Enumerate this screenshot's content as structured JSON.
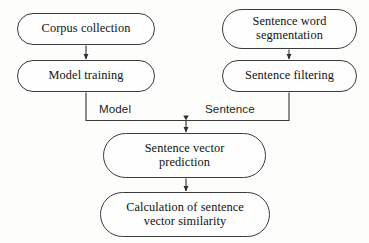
{
  "diagram": {
    "type": "flowchart",
    "background_color": "#fdfdfc",
    "stroke_color": "#3b3b3b",
    "text_color": "#111111",
    "nodes": [
      {
        "id": "corpus-collection",
        "label": "Corpus collection",
        "shape": "rounded-pill",
        "column": "left",
        "order": 1
      },
      {
        "id": "model-training",
        "label": "Model training",
        "shape": "rounded-pill",
        "column": "left",
        "order": 2
      },
      {
        "id": "sentence-word-segmentation",
        "label": "Sentence word\nsegmentation",
        "shape": "rounded-pill",
        "column": "right",
        "order": 1
      },
      {
        "id": "sentence-filtering",
        "label": "Sentence filtering",
        "shape": "rounded-pill",
        "column": "right",
        "order": 2
      },
      {
        "id": "sentence-vector-prediction",
        "label": "Sentence vector\nprediction",
        "shape": "rounded-pill",
        "column": "center",
        "order": 3
      },
      {
        "id": "calculation-of-sentence-vector-similarity",
        "label": "Calculation of sentence\nvector similarity",
        "shape": "rounded-pill",
        "column": "center",
        "order": 4
      }
    ],
    "edges": [
      {
        "id": "edge-corpus-to-model",
        "from": "corpus-collection",
        "to": "model-training",
        "label": "",
        "arrow": true
      },
      {
        "id": "edge-segmentation-to-filtering",
        "from": "sentence-word-segmentation",
        "to": "sentence-filtering",
        "label": "",
        "arrow": true
      },
      {
        "id": "edge-model-to-prediction",
        "from": "model-training",
        "to": "sentence-vector-prediction",
        "label": "Model",
        "arrow": true
      },
      {
        "id": "edge-filtering-to-prediction",
        "from": "sentence-filtering",
        "to": "sentence-vector-prediction",
        "label": "Sentence",
        "arrow": true
      },
      {
        "id": "edge-prediction-to-calculation",
        "from": "sentence-vector-prediction",
        "to": "calculation-of-sentence-vector-similarity",
        "label": "",
        "arrow": true
      }
    ],
    "edge_labels": {
      "model": "Model",
      "sentence": "Sentence"
    }
  }
}
